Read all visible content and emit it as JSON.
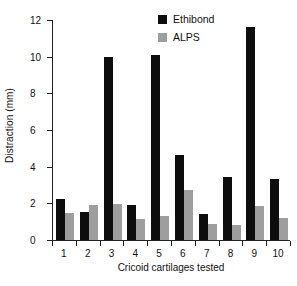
{
  "chart_data": {
    "type": "bar",
    "title": "",
    "xlabel": "Cricoid cartilages tested",
    "ylabel": "Distraction (mm)",
    "categories": [
      "1",
      "2",
      "3",
      "4",
      "5",
      "6",
      "7",
      "8",
      "9",
      "10"
    ],
    "ylim": [
      0,
      12
    ],
    "yticks": [
      0,
      2,
      4,
      6,
      8,
      10,
      12
    ],
    "ytick_labels": [
      "0",
      "2",
      "4",
      "6",
      "8",
      "10",
      "12"
    ],
    "grid": false,
    "legend_position": "top-right",
    "series": [
      {
        "name": "Ethibond",
        "color": "#0d0d0d",
        "values": [
          2.25,
          1.55,
          10.0,
          1.9,
          10.1,
          4.65,
          1.4,
          3.45,
          11.6,
          3.35
        ]
      },
      {
        "name": "ALPS",
        "color": "#9e9e9e",
        "values": [
          1.45,
          1.9,
          1.95,
          1.15,
          1.3,
          2.75,
          0.85,
          0.8,
          1.85,
          1.2
        ]
      }
    ]
  }
}
